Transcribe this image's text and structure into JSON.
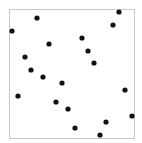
{
  "chart_data": {
    "type": "scatter",
    "title": "",
    "xlabel": "",
    "ylabel": "",
    "grid": false,
    "legend": null,
    "axis_ticks": false,
    "xlim": [
      0,
      1
    ],
    "ylim": [
      0,
      1
    ],
    "frame_px": {
      "left": 9,
      "top": 9,
      "right": 134,
      "bottom": 138
    },
    "marker_color": "#111111",
    "frame_color": "#c8c8c8",
    "points_px": [
      [
        119,
        12
      ],
      [
        37,
        18
      ],
      [
        113,
        25
      ],
      [
        12,
        31
      ],
      [
        82,
        38
      ],
      [
        49,
        44
      ],
      [
        88,
        51
      ],
      [
        25,
        57
      ],
      [
        94,
        63
      ],
      [
        31,
        70
      ],
      [
        43,
        77
      ],
      [
        62,
        83
      ],
      [
        125,
        90
      ],
      [
        18,
        96
      ],
      [
        56,
        102
      ],
      [
        68,
        109
      ],
      [
        132,
        116
      ],
      [
        106,
        122
      ],
      [
        75,
        128
      ],
      [
        100,
        135
      ]
    ],
    "points": [
      {
        "x": 0.88,
        "y": 0.98
      },
      {
        "x": 0.22,
        "y": 0.93
      },
      {
        "x": 0.83,
        "y": 0.88
      },
      {
        "x": 0.02,
        "y": 0.83
      },
      {
        "x": 0.58,
        "y": 0.78
      },
      {
        "x": 0.32,
        "y": 0.73
      },
      {
        "x": 0.63,
        "y": 0.67
      },
      {
        "x": 0.13,
        "y": 0.63
      },
      {
        "x": 0.68,
        "y": 0.58
      },
      {
        "x": 0.18,
        "y": 0.53
      },
      {
        "x": 0.27,
        "y": 0.47
      },
      {
        "x": 0.42,
        "y": 0.43
      },
      {
        "x": 0.93,
        "y": 0.37
      },
      {
        "x": 0.07,
        "y": 0.33
      },
      {
        "x": 0.38,
        "y": 0.28
      },
      {
        "x": 0.47,
        "y": 0.22
      },
      {
        "x": 0.98,
        "y": 0.17
      },
      {
        "x": 0.78,
        "y": 0.12
      },
      {
        "x": 0.53,
        "y": 0.08
      },
      {
        "x": 0.73,
        "y": 0.02
      }
    ]
  }
}
